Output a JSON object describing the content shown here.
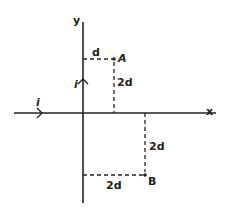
{
  "diagram": {
    "type": "coordinate-geometry",
    "axes": {
      "x_label": "x",
      "y_label": "y"
    },
    "currents": [
      {
        "label": "i",
        "along": "x-axis",
        "direction": "positive x"
      },
      {
        "label": "i",
        "along": "y-axis",
        "direction": "positive y"
      }
    ],
    "points": [
      {
        "label": "A",
        "quadrant": 1,
        "x_offset_label": "d",
        "y_offset_label": "2d"
      },
      {
        "label": "B",
        "quadrant": 4,
        "x_offset_label": "2d",
        "y_offset_label": "2d"
      }
    ],
    "dimension_labels": {
      "a_horizontal": "d",
      "a_vertical": "2d",
      "b_vertical": "2d",
      "b_horizontal": "2d"
    },
    "colors": {
      "line": "#222222",
      "background": "#ffffff"
    }
  }
}
